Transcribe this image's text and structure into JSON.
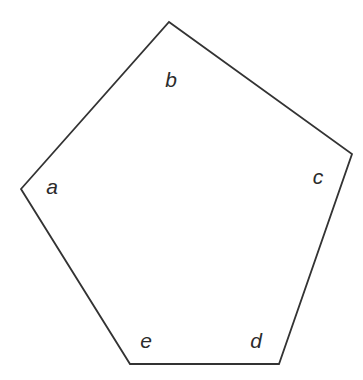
{
  "figure": {
    "title": "",
    "background_color": "#ffffff",
    "stroke_color": "#333333",
    "stroke_width": 1.8,
    "fill_color": "#ffffff",
    "width": 363,
    "height": 380
  },
  "chart_data": {
    "type": "diagram",
    "shape": "pentagon",
    "title": "",
    "xlabel": "",
    "ylabel": "",
    "grid": false,
    "legend": null,
    "vertices": [
      {
        "name": "a",
        "x": 21,
        "y": 189
      },
      {
        "name": "b",
        "x": 169,
        "y": 22
      },
      {
        "name": "c",
        "x": 352,
        "y": 154
      },
      {
        "name": "d",
        "x": 279,
        "y": 364
      },
      {
        "name": "e",
        "x": 130,
        "y": 364
      }
    ],
    "edges": [
      {
        "from": "a",
        "to": "b"
      },
      {
        "from": "b",
        "to": "c"
      },
      {
        "from": "c",
        "to": "d"
      },
      {
        "from": "d",
        "to": "e"
      },
      {
        "from": "e",
        "to": "a"
      }
    ],
    "labels": [
      {
        "text": "a",
        "x": 52,
        "y": 186
      },
      {
        "text": "b",
        "x": 171,
        "y": 79
      },
      {
        "text": "c",
        "x": 318,
        "y": 176
      },
      {
        "text": "d",
        "x": 256,
        "y": 340
      },
      {
        "text": "e",
        "x": 146,
        "y": 340
      }
    ]
  }
}
